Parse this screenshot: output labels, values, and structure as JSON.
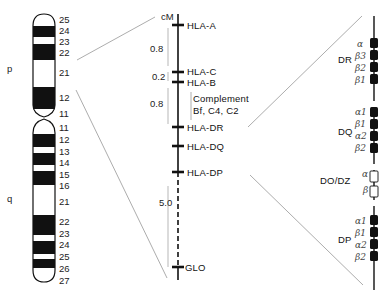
{
  "chromosome": {
    "arm_labels": {
      "p": "p",
      "q": "q"
    },
    "p_bands": [
      "25",
      "24",
      "23",
      "22",
      "21",
      "12",
      "11"
    ],
    "q_bands": [
      "11",
      "12",
      "13",
      "14",
      "15",
      "16",
      "21",
      "22",
      "23",
      "24",
      "25",
      "26",
      "27"
    ]
  },
  "map": {
    "unit": "cM",
    "loci": [
      "HLA-A",
      "HLA-C",
      "HLA-B",
      "HLA-DR",
      "HLA-DQ",
      "HLA-DP",
      "GLO"
    ],
    "distances": [
      "0.8",
      "0.2",
      "0.8",
      "5.0"
    ],
    "complement_label_line1": "Complement",
    "complement_label_line2": "Bf, C4, C2"
  },
  "class2": {
    "regions": [
      {
        "name": "DR",
        "genes": [
          "α",
          "β3",
          "β2",
          "β1"
        ]
      },
      {
        "name": "DQ",
        "genes": [
          "α1",
          "β1",
          "α2",
          "β2"
        ]
      },
      {
        "name": "DO/DZ",
        "genes": [
          "α",
          "β"
        ]
      },
      {
        "name": "DP",
        "genes": [
          "α1",
          "β1",
          "α2",
          "β2"
        ]
      }
    ]
  }
}
